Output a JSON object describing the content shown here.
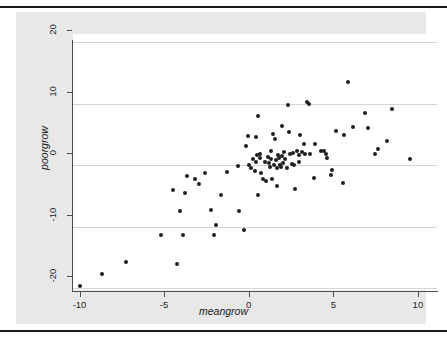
{
  "page": {
    "background": "#ffffff",
    "rule_color": "#1a1a1a"
  },
  "graph": {
    "graph_region_color": "#e8e8e8",
    "plot_region_color": "#ffffff",
    "gridline_color": "#d4d4d4",
    "axis_color": "#4d4d4d",
    "marker_color": "#1f1f1f"
  },
  "chart_data": {
    "type": "scatter",
    "title": "",
    "xlabel": "meangrow",
    "ylabel": "poorgrow",
    "xlim": [
      -11.5,
      10.5
    ],
    "ylim": [
      -21.0,
      21.5
    ],
    "xticks": [
      -10,
      -5,
      0,
      5,
      10
    ],
    "xtick_labels": [
      "-10",
      "-5",
      "0",
      "5",
      "10"
    ],
    "yticks": [
      -20,
      -10,
      0,
      10,
      20
    ],
    "ytick_labels": [
      "-20",
      "-10",
      "0",
      "10",
      "20"
    ],
    "grid": "horizontal",
    "legend": null,
    "marker": "filled-circle",
    "n_points": 96,
    "points": [
      [
        -10.9,
        -19.7
      ],
      [
        -9.6,
        -17.7
      ],
      [
        -8.2,
        -15.7
      ],
      [
        -6.1,
        -11.3
      ],
      [
        -5.4,
        -4.0
      ],
      [
        -5.2,
        -16.0
      ],
      [
        -5.0,
        -7.4
      ],
      [
        -4.8,
        -11.3
      ],
      [
        -4.7,
        -4.5
      ],
      [
        -4.6,
        -1.7
      ],
      [
        -4.1,
        -2.3
      ],
      [
        -3.9,
        -3.0
      ],
      [
        -3.5,
        -1.2
      ],
      [
        -3.2,
        -7.2
      ],
      [
        -3.0,
        -11.3
      ],
      [
        -2.9,
        -9.7
      ],
      [
        -2.6,
        -4.9
      ],
      [
        -2.2,
        -1.1
      ],
      [
        -1.6,
        -0.1
      ],
      [
        -1.5,
        -7.4
      ],
      [
        -1.2,
        -10.5
      ],
      [
        -1.1,
        3.1
      ],
      [
        -1.0,
        4.7
      ],
      [
        -0.9,
        0.0
      ],
      [
        -0.8,
        -0.4
      ],
      [
        -0.7,
        1.0
      ],
      [
        -0.6,
        -1.0
      ],
      [
        -0.5,
        4.6
      ],
      [
        -0.5,
        0.5
      ],
      [
        -0.45,
        1.6
      ],
      [
        -0.4,
        8.0
      ],
      [
        -0.4,
        -4.8
      ],
      [
        -0.3,
        1.8
      ],
      [
        -0.25,
        1.2
      ],
      [
        -0.2,
        -1.2
      ],
      [
        -0.1,
        -2.3
      ],
      [
        0.0,
        0.6
      ],
      [
        0.1,
        -2.6
      ],
      [
        0.2,
        1.4
      ],
      [
        0.25,
        0.3
      ],
      [
        0.3,
        -0.2
      ],
      [
        0.35,
        2.4
      ],
      [
        0.4,
        1.1
      ],
      [
        0.45,
        -2.2
      ],
      [
        0.5,
        5.1
      ],
      [
        0.55,
        0.0
      ],
      [
        0.6,
        4.2
      ],
      [
        0.65,
        0.9
      ],
      [
        0.7,
        -0.4
      ],
      [
        0.75,
        -3.4
      ],
      [
        0.8,
        1.7
      ],
      [
        0.85,
        1.2
      ],
      [
        0.9,
        0.0
      ],
      [
        0.95,
        -0.2
      ],
      [
        1.0,
        6.4
      ],
      [
        1.05,
        1.5
      ],
      [
        1.1,
        0.4
      ],
      [
        1.15,
        2.2
      ],
      [
        1.2,
        1.0
      ],
      [
        1.3,
        -0.5
      ],
      [
        1.4,
        9.8
      ],
      [
        1.45,
        5.4
      ],
      [
        1.5,
        1.9
      ],
      [
        1.6,
        0.2
      ],
      [
        1.7,
        2.0
      ],
      [
        1.75,
        0.1
      ],
      [
        1.8,
        -3.8
      ],
      [
        1.9,
        2.3
      ],
      [
        2.0,
        1.7
      ],
      [
        2.05,
        0.6
      ],
      [
        2.1,
        5.0
      ],
      [
        2.2,
        2.1
      ],
      [
        2.3,
        3.4
      ],
      [
        2.4,
        1.9
      ],
      [
        2.5,
        10.3
      ],
      [
        2.6,
        10.0
      ],
      [
        2.7,
        1.8
      ],
      [
        2.9,
        -2.0
      ],
      [
        3.0,
        3.5
      ],
      [
        3.3,
        2.4
      ],
      [
        3.5,
        2.3
      ],
      [
        3.6,
        1.8
      ],
      [
        3.7,
        1.2
      ],
      [
        3.9,
        -1.5
      ],
      [
        4.0,
        -0.7
      ],
      [
        4.2,
        5.6
      ],
      [
        4.6,
        -2.8
      ],
      [
        4.7,
        4.9
      ],
      [
        4.9,
        13.6
      ],
      [
        5.2,
        6.2
      ],
      [
        5.9,
        8.5
      ],
      [
        6.1,
        6.0
      ],
      [
        6.5,
        1.8
      ],
      [
        6.7,
        2.7
      ],
      [
        7.2,
        3.9
      ],
      [
        7.5,
        9.1
      ],
      [
        8.6,
        1.0
      ]
    ]
  }
}
